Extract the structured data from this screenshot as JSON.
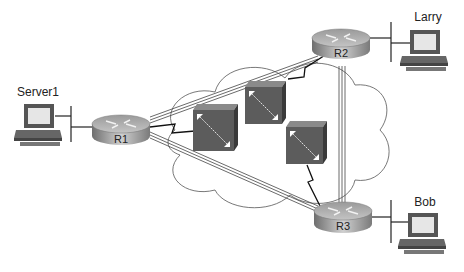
{
  "diagram": {
    "type": "network-topology",
    "nodes": {
      "server1": {
        "label": "Server1",
        "kind": "pc"
      },
      "larry": {
        "label": "Larry",
        "kind": "pc"
      },
      "bob": {
        "label": "Bob",
        "kind": "pc"
      },
      "r1": {
        "label": "R1",
        "kind": "router"
      },
      "r2": {
        "label": "R2",
        "kind": "router"
      },
      "r3": {
        "label": "R3",
        "kind": "router"
      },
      "sw1": {
        "label": "",
        "kind": "frame-relay-switch"
      },
      "sw2": {
        "label": "",
        "kind": "frame-relay-switch"
      },
      "sw3": {
        "label": "",
        "kind": "frame-relay-switch"
      }
    },
    "links": [
      {
        "from": "R1",
        "to": "R2",
        "type": "virtual-circuit"
      },
      {
        "from": "R1",
        "to": "R3",
        "type": "virtual-circuit"
      },
      {
        "from": "R2",
        "to": "R3",
        "type": "virtual-circuit"
      },
      {
        "from": "R1",
        "to": "switch",
        "type": "serial"
      },
      {
        "from": "R2",
        "to": "switch",
        "type": "serial"
      },
      {
        "from": "R3",
        "to": "switch",
        "type": "serial"
      },
      {
        "from": "Server1",
        "to": "R1",
        "type": "ethernet"
      },
      {
        "from": "Larry",
        "to": "R2",
        "type": "ethernet"
      },
      {
        "from": "Bob",
        "to": "R3",
        "type": "ethernet"
      }
    ],
    "cloud": {
      "label": ""
    }
  }
}
